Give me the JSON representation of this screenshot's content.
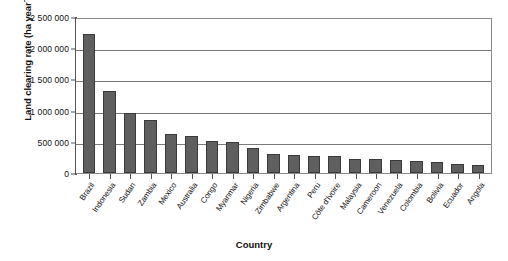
{
  "chart_data": {
    "type": "bar",
    "title": "",
    "xlabel": "Country",
    "ylabel": "Land clearing rate (ha year-1)",
    "ylabel_main": "Land clearing rate (ha year",
    "ylabel_sup": "−1",
    "ylabel_tail": ")",
    "ylim": [
      0,
      2500000
    ],
    "grid": true,
    "legend": "none",
    "ytick_labels": [
      "2 500 000",
      "2 000 000",
      "1 500 000",
      "1 000 000",
      "500 000",
      "0"
    ],
    "ytick_values": [
      2500000,
      2000000,
      1500000,
      1000000,
      500000,
      0
    ],
    "categories": [
      "Brazil",
      "Indonesia",
      "Sudan",
      "Zambia",
      "Mexico",
      "Australia",
      "Congo",
      "Myanmar",
      "Nigeria",
      "Zimbabwe",
      "Argentina",
      "Peru",
      "Côte d'Ivoire",
      "Malaysia",
      "Cameroon",
      "Venezuela",
      "Colombia",
      "Bolivia",
      "Ecuador",
      "Angola"
    ],
    "values": [
      2230000,
      1320000,
      960000,
      850000,
      630000,
      590000,
      520000,
      490000,
      400000,
      310000,
      285000,
      270000,
      265000,
      230000,
      220000,
      215000,
      190000,
      170000,
      150000,
      125000
    ],
    "bar_color": "#5f5f5f",
    "bar_border_color": "#3a3a3a",
    "axis_color": "#555555",
    "grid_color": "#7a7a7a",
    "background": "#ffffff"
  }
}
